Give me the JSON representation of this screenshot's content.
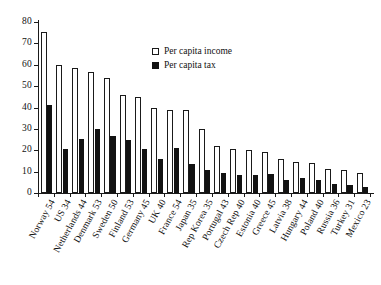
{
  "chart_data": {
    "type": "bar",
    "title": "",
    "subtitle": "",
    "xlabel": "",
    "ylabel": "",
    "ylim": [
      0,
      80
    ],
    "yticks": [
      0,
      10,
      20,
      30,
      40,
      50,
      60,
      70,
      80
    ],
    "grid": false,
    "legend_position": "upper-center",
    "categories": [
      "Norway 54",
      "US 34",
      "Netherlands 44",
      "Denmark 53",
      "Sweden 50",
      "Finland 53",
      "Germany 45",
      "UK 40",
      "France 54",
      "Japan 35",
      "Rep Korea 35",
      "Portugal 43",
      "Czech Rep 40",
      "Estonia 40",
      "Greece 45",
      "Latvia 38",
      "Hungary 44",
      "Poland 40",
      "Russia 36",
      "Turkey 31",
      "Mexico 23"
    ],
    "series": [
      {
        "name": "Per capita income",
        "style": "hollow",
        "color": "#ffffff",
        "edge_color": "#1a1a1a",
        "values": [
          75.5,
          59.8,
          58.3,
          56.6,
          53.7,
          46.0,
          44.8,
          40.0,
          38.8,
          38.8,
          30.1,
          21.8,
          20.8,
          20.3,
          19.1,
          15.9,
          14.6,
          14.1,
          11.2,
          10.9,
          9.5
        ]
      },
      {
        "name": "Per capita tax",
        "style": "filled",
        "color": "#121212",
        "edge_color": "#121212",
        "values": [
          41.3,
          20.6,
          25.5,
          29.9,
          26.9,
          24.7,
          20.4,
          15.7,
          20.9,
          13.8,
          10.9,
          9.4,
          8.5,
          8.2,
          8.8,
          6.2,
          6.9,
          6.0,
          4.3,
          3.7,
          2.6
        ]
      }
    ]
  },
  "legend": {
    "items": [
      {
        "label": "Per capita income",
        "style": "income"
      },
      {
        "label": "Per capita tax",
        "style": "tax"
      }
    ]
  }
}
